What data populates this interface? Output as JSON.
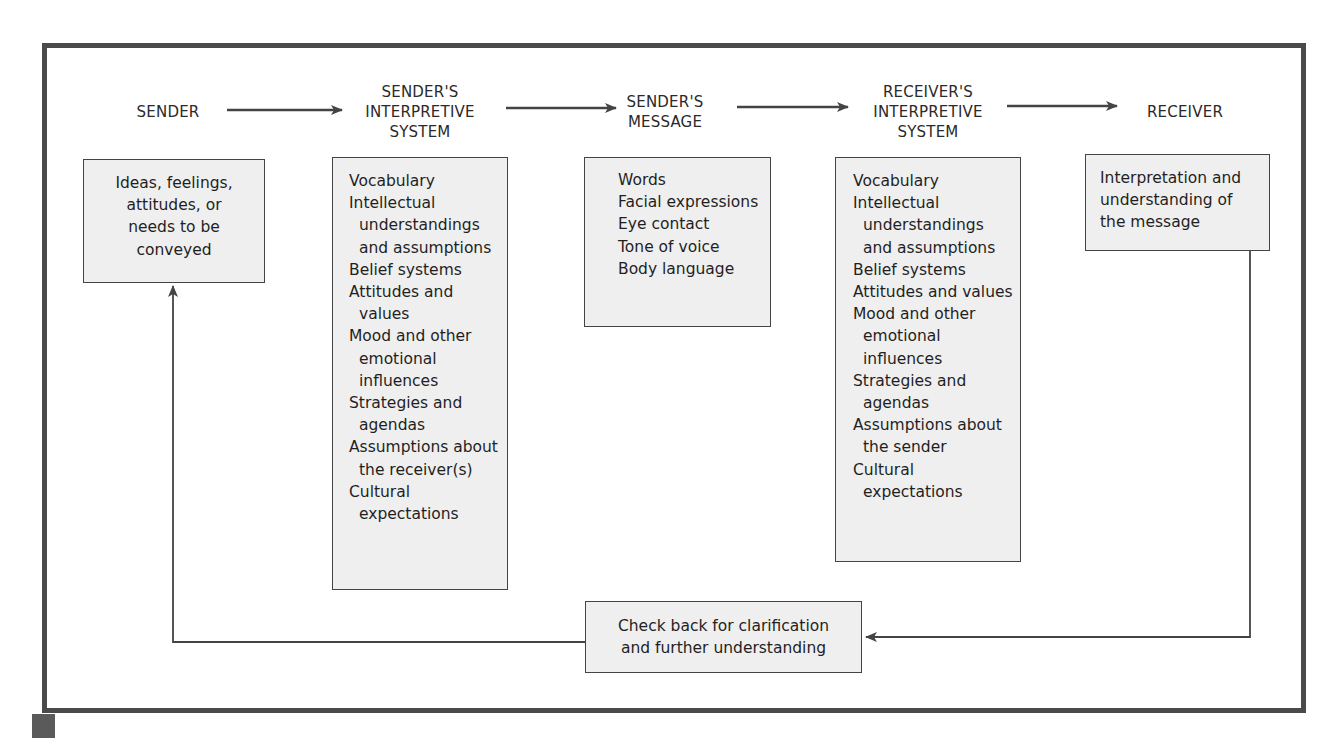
{
  "diagram": {
    "headers": [
      {
        "id": "sender",
        "label": "SENDER"
      },
      {
        "id": "sender-interpretive-system",
        "label": "SENDER'S\nINTERPRETIVE\nSYSTEM"
      },
      {
        "id": "sender-message",
        "label": "SENDER'S\nMESSAGE"
      },
      {
        "id": "receiver-interpretive-system",
        "label": "RECEIVER'S\nINTERPRETIVE\nSYSTEM"
      },
      {
        "id": "receiver",
        "label": "RECEIVER"
      }
    ],
    "boxes": {
      "sender": {
        "text": "Ideas, feelings,\nattitudes, or\nneeds to be\nconveyed"
      },
      "sender_interpretive_system": {
        "items": [
          "Vocabulary",
          "Intellectual understandings and assumptions",
          "Belief systems",
          "Attitudes and values",
          "Mood and other emotional influences",
          "Strategies and agendas",
          "Assumptions about the receiver(s)",
          "Cultural expectations"
        ]
      },
      "sender_message": {
        "items": [
          "Words",
          "Facial expressions",
          "Eye contact",
          "Tone of voice",
          "Body language"
        ]
      },
      "receiver_interpretive_system": {
        "items": [
          "Vocabulary",
          "Intellectual understandings and assumptions",
          "Belief systems",
          "Attitudes and values",
          "Mood and other emotional influences",
          "Strategies and agendas",
          "Assumptions about the sender",
          "Cultural expectations"
        ]
      },
      "receiver": {
        "text": "Interpretation and\nunderstanding of\nthe message"
      },
      "feedback": {
        "text": "Check back for clarification\nand further understanding"
      }
    },
    "colors": {
      "frame": "#4a4a4a",
      "box_fill": "#efefef",
      "box_border": "#444444",
      "arrow": "#444444",
      "text": "#222222"
    }
  }
}
